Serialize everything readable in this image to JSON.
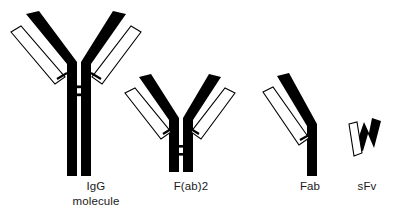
{
  "figure": {
    "background_color": "#ffffff",
    "heavy_chain_color": "#000000",
    "light_chain_color": "#ffffff",
    "outline_color": "#000000",
    "label_color": "#1a1a1a"
  },
  "structures": [
    {
      "id": "igg",
      "label_line1": "IgG",
      "label_line2": "molecule",
      "description": "Complete IgG antibody: two heavy chains forming a Y with Fc stem, two light chains, hinge disulfide bonds",
      "heavy_chains": 2,
      "light_chains": 2,
      "hinge_disulfides": 2,
      "has_fc_region": true
    },
    {
      "id": "fab2",
      "label_line1": "F(ab)2",
      "label_line2": "",
      "description": "F(ab)2 fragment: two antigen-binding arms joined at the hinge, Fc region removed",
      "heavy_chains": 2,
      "light_chains": 2,
      "hinge_disulfides": 2,
      "has_fc_region": false
    },
    {
      "id": "fab",
      "label_line1": "Fab",
      "label_line2": "",
      "description": "Fab fragment: single antigen-binding arm, one heavy chain portion plus one light chain",
      "heavy_chains": 1,
      "light_chains": 1,
      "hinge_disulfides": 0,
      "has_fc_region": false
    },
    {
      "id": "sfv",
      "label_line1": "sFv",
      "label_line2": "",
      "description": "Single-chain Fv fragment: variable heavy domain linked to variable light domain",
      "heavy_chains": 1,
      "light_chains": 1,
      "hinge_disulfides": 0,
      "has_fc_region": false
    }
  ],
  "labels": {
    "igg_line1": "IgG",
    "igg_line2": "molecule",
    "fab2": "F(ab)2",
    "fab": "Fab",
    "sfv": "sFv"
  },
  "label_positions": {
    "igg_x": 96,
    "igg_y1": 190,
    "igg_y2": 205,
    "fab2_x": 191,
    "fab2_y": 190,
    "fab_x": 310,
    "fab_y": 190,
    "sfv_x": 367,
    "sfv_y": 190
  }
}
